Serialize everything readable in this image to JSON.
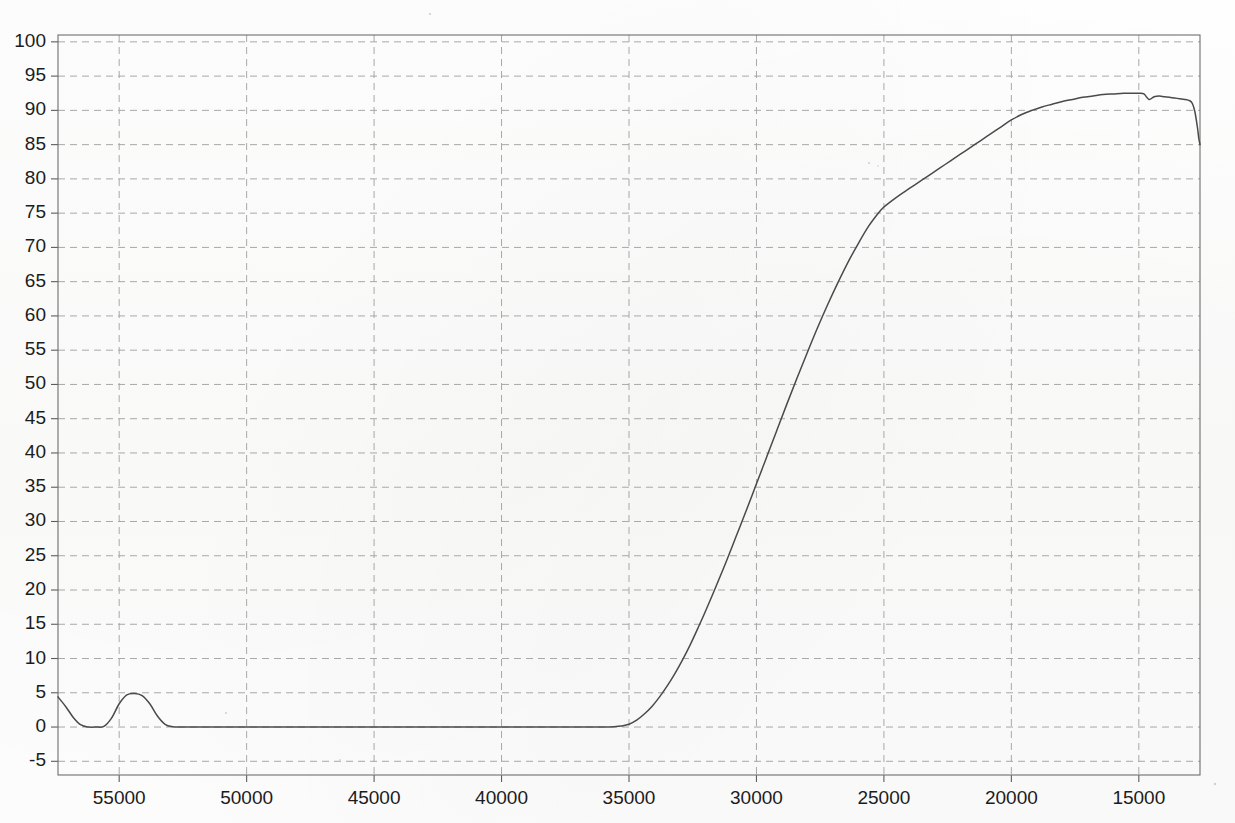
{
  "chart_data": {
    "type": "line",
    "title": "",
    "subtitle": "",
    "xlabel": "",
    "ylabel": "",
    "grid": true,
    "legend": null,
    "x_axis_reversed": true,
    "xlim": [
      57400,
      12600
    ],
    "ylim": [
      -7,
      101
    ],
    "x_ticks": [
      55000,
      50000,
      45000,
      40000,
      35000,
      30000,
      25000,
      20000,
      15000
    ],
    "x_tick_labels": [
      "55000",
      "50000",
      "45000",
      "40000",
      "35000",
      "30000",
      "25000",
      "20000",
      "15000"
    ],
    "y_ticks": [
      -5,
      0,
      5,
      10,
      15,
      20,
      25,
      30,
      35,
      40,
      45,
      50,
      55,
      60,
      65,
      70,
      75,
      80,
      85,
      90,
      95,
      100
    ],
    "y_tick_labels": [
      "-5",
      "0",
      "5",
      "10",
      "15",
      "20",
      "25",
      "30",
      "35",
      "40",
      "45",
      "50",
      "55",
      "60",
      "65",
      "70",
      "75",
      "80",
      "85",
      "90",
      "95",
      "100"
    ],
    "series": [
      {
        "name": "transmittance",
        "color": "#4a4a4a",
        "x": [
          57400,
          57100,
          56800,
          56500,
          56200,
          55900,
          55600,
          55300,
          55000,
          54700,
          54400,
          54100,
          53800,
          53500,
          53200,
          52900,
          52600,
          52300,
          52000,
          51000,
          50000,
          48000,
          46000,
          44000,
          42000,
          40000,
          38000,
          37000,
          36500,
          36000,
          35600,
          35300,
          35000,
          34700,
          34400,
          34100,
          33800,
          33500,
          33200,
          32900,
          32600,
          32300,
          32000,
          31600,
          31200,
          30800,
          30400,
          30000,
          29600,
          29200,
          28800,
          28400,
          28000,
          27600,
          27200,
          26800,
          26400,
          26000,
          25600,
          25200,
          25000,
          24800,
          24400,
          24000,
          23600,
          23200,
          22800,
          22400,
          22000,
          21600,
          21200,
          20800,
          20400,
          20000,
          19600,
          19200,
          18800,
          18400,
          18000,
          17600,
          17200,
          16800,
          16400,
          16000,
          15600,
          15200,
          15000,
          14800,
          14600,
          14400,
          14200,
          14000,
          13800,
          13600,
          13400,
          13200,
          13000,
          12900,
          12800,
          12700,
          12650,
          12600
        ],
        "y": [
          4.4,
          3.0,
          1.4,
          0.3,
          0.0,
          0.0,
          0.1,
          1.3,
          3.4,
          4.7,
          4.9,
          4.6,
          3.4,
          1.6,
          0.4,
          0.05,
          0.0,
          0.0,
          0.0,
          0.0,
          0.0,
          0.0,
          0.0,
          0.0,
          0.0,
          0.0,
          0.0,
          0.0,
          0.0,
          0.0,
          0.05,
          0.15,
          0.4,
          1.0,
          1.9,
          3.0,
          4.4,
          6.0,
          7.8,
          9.8,
          12.0,
          14.4,
          16.9,
          20.4,
          24.0,
          27.8,
          31.6,
          35.5,
          39.4,
          43.3,
          47.2,
          51.0,
          54.7,
          58.3,
          61.7,
          64.9,
          67.9,
          70.6,
          73.1,
          75.1,
          75.9,
          76.5,
          77.6,
          78.6,
          79.6,
          80.6,
          81.6,
          82.6,
          83.6,
          84.6,
          85.6,
          86.6,
          87.6,
          88.6,
          89.4,
          90.0,
          90.5,
          90.9,
          91.3,
          91.6,
          91.9,
          92.1,
          92.3,
          92.4,
          92.5,
          92.5,
          92.5,
          92.4,
          91.6,
          92.0,
          92.1,
          92.0,
          91.9,
          91.8,
          91.7,
          91.6,
          91.4,
          91.0,
          89.8,
          87.5,
          86.0,
          85.0
        ]
      }
    ],
    "annotations": []
  },
  "axes": {
    "plot_left_px": 58,
    "plot_right_px": 1200,
    "plot_top_px": 35,
    "plot_bottom_px": 775
  },
  "colors": {
    "background": "#fdfdfc",
    "frame": "#6e6e6e",
    "grid": "#a8a8a8",
    "line": "#4a4a4a",
    "text": "#1c1c1c"
  }
}
